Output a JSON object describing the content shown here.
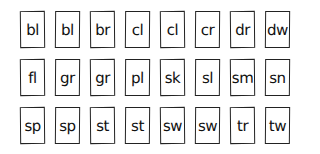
{
  "cards": {
    "rows": [
      [
        "bl",
        "bl",
        "br",
        "cl",
        "cl",
        "cr",
        "dr",
        "dw"
      ],
      [
        "fl",
        "gr",
        "gr",
        "pl",
        "sk",
        "sl",
        "sm",
        "sn"
      ],
      [
        "sp",
        "sp",
        "st",
        "st",
        "sw",
        "sw",
        "tr",
        "tw"
      ]
    ]
  }
}
